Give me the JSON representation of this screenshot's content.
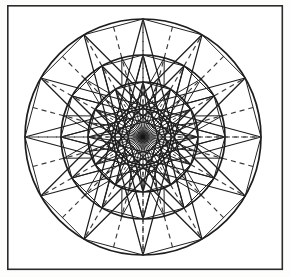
{
  "page": {
    "background_color": "#fdfdfb",
    "width": 290,
    "height": 277
  },
  "frame": {
    "name": "border-frame",
    "x": 7,
    "y": 5,
    "width": 276,
    "height": 265,
    "stroke_color": "#2b2b2b",
    "stroke_width": 1.6
  },
  "figure": {
    "center_x": 143,
    "center_y": 137,
    "divisions": 24,
    "line_color": "#1d1d1d",
    "dash_color": "#3a3a3a",
    "rings": [
      {
        "label": "outer-ring",
        "radius": 118,
        "stroke_width": 1.7
      },
      {
        "label": "third-ring",
        "radius": 82,
        "stroke_width": 1.7
      },
      {
        "label": "second-ring",
        "radius": 55,
        "stroke_width": 1.6
      },
      {
        "label": "inner-ring",
        "radius": 28,
        "stroke_width": 1.5
      }
    ],
    "bands": [
      {
        "label": "outer-band",
        "inner_radius": 82,
        "outer_radius": 118,
        "spoke_style": "dashed",
        "spoke_count": 24,
        "star_step": 0,
        "has_star": false
      },
      {
        "label": "middle-band",
        "inner_radius": 55,
        "outer_radius": 82,
        "spoke_style": "dashed",
        "spoke_count": 24,
        "star_step": 2,
        "has_star": true
      },
      {
        "label": "second-band",
        "inner_radius": 28,
        "outer_radius": 55,
        "spoke_style": "dashed",
        "spoke_count": 24,
        "star_step": 2,
        "has_star": true
      },
      {
        "label": "core-band",
        "inner_radius": 0,
        "outer_radius": 28,
        "spoke_style": "solid",
        "spoke_count": 24,
        "star_step": 0,
        "has_star": false
      }
    ],
    "star_polygons": [
      {
        "label": "outer-star",
        "radius": 118,
        "points": 12,
        "step": 5,
        "stroke_width": 1.25
      },
      {
        "label": "mid-star",
        "radius": 82,
        "points": 12,
        "step": 5,
        "stroke_width": 1.25
      },
      {
        "label": "inner-star",
        "radius": 55,
        "points": 12,
        "step": 5,
        "stroke_width": 1.1
      }
    ],
    "hub": {
      "label": "center-hub",
      "radius": 2.2,
      "fill": "#141414"
    },
    "axes": {
      "horizontal_dashed": true,
      "vertical_dashed": true
    }
  }
}
